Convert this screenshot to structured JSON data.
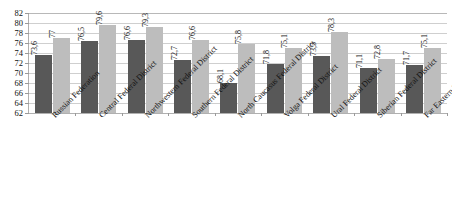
{
  "chart_data": {
    "type": "bar",
    "title": "",
    "subtitle": "",
    "xlabel": "",
    "ylabel": "",
    "ylim": [
      62,
      82
    ],
    "ytick_step": 2,
    "yticks": [
      62,
      64,
      66,
      68,
      70,
      72,
      74,
      76,
      78,
      80,
      82
    ],
    "grid": true,
    "legend": "none",
    "categories": [
      "Russian Federation",
      "Central Federal District",
      "Northwestern Federal District",
      "Southern Federal District",
      "North Caucasus Federal District",
      "Volga Federal District",
      "Ural Federal District",
      "Siberian Federal District",
      "Far Eastern Federal District"
    ],
    "series": [
      {
        "name": "series-1",
        "color": "#585858",
        "values": [
          73.6,
          76.5,
          76.6,
          72.7,
          68.1,
          71.8,
          73.5,
          71.1,
          71.7
        ],
        "labels": [
          "73,6",
          "76,5",
          "76,6",
          "72,7",
          "68,1",
          "71,8",
          "73,5",
          "71,1",
          "71,7"
        ]
      },
      {
        "name": "series-2",
        "color": "#bdbdbd",
        "values": [
          77.0,
          79.6,
          79.3,
          76.6,
          75.8,
          75.1,
          78.3,
          72.8,
          75.1
        ],
        "labels": [
          "77",
          "79,6",
          "79,3",
          "76,6",
          "75,8",
          "75,1",
          "78,3",
          "72,8",
          "75,1"
        ]
      }
    ]
  }
}
